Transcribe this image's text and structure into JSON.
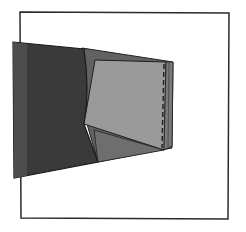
{
  "illustration": {
    "title": "Fabric panels with folded piece and stitching line",
    "colors": {
      "background": "#ffffff",
      "frame": "#2a2a2a",
      "dark_panel": "#3a3a3a",
      "dark_panel_edge": "#4a4a4a",
      "mid_panel": "#626262",
      "light_panel": "#9a9a9a",
      "lower_flap": "#6e6e6e",
      "stitch": "#1e1e1e"
    }
  }
}
